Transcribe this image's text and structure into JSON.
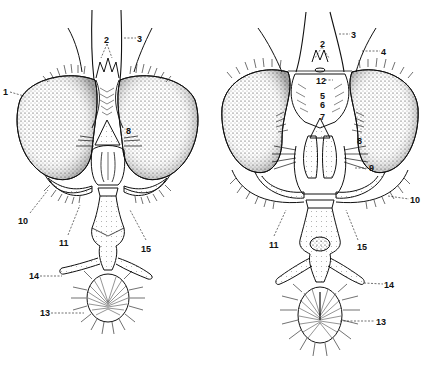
{
  "figure": {
    "type": "anatomical-line-drawing",
    "panels": [
      {
        "id": "left",
        "labels": [
          {
            "text": "1",
            "x": 3,
            "y": 88
          },
          {
            "text": "2",
            "x": 104,
            "y": 36
          },
          {
            "text": "3",
            "x": 137,
            "y": 35
          },
          {
            "text": "8",
            "x": 126,
            "y": 127
          },
          {
            "text": "10",
            "x": 18,
            "y": 217
          },
          {
            "text": "11",
            "x": 59,
            "y": 239
          },
          {
            "text": "15",
            "x": 141,
            "y": 245
          },
          {
            "text": "14",
            "x": 29,
            "y": 272
          },
          {
            "text": "13",
            "x": 40,
            "y": 309
          }
        ]
      },
      {
        "id": "right",
        "labels": [
          {
            "text": "2",
            "x": 320,
            "y": 40
          },
          {
            "text": "3",
            "x": 351,
            "y": 31
          },
          {
            "text": "4",
            "x": 381,
            "y": 48
          },
          {
            "text": "12",
            "x": 316,
            "y": 77
          },
          {
            "text": "5",
            "x": 320,
            "y": 92
          },
          {
            "text": "6",
            "x": 320,
            "y": 101
          },
          {
            "text": "7",
            "x": 320,
            "y": 113
          },
          {
            "text": "8",
            "x": 357,
            "y": 137
          },
          {
            "text": "9",
            "x": 369,
            "y": 164
          },
          {
            "text": "10",
            "x": 410,
            "y": 196
          },
          {
            "text": "11",
            "x": 269,
            "y": 241
          },
          {
            "text": "15",
            "x": 357,
            "y": 243
          },
          {
            "text": "14",
            "x": 384,
            "y": 281
          },
          {
            "text": "13",
            "x": 376,
            "y": 318
          }
        ]
      }
    ]
  },
  "colors": {
    "ink": "#111111",
    "paper": "#ffffff",
    "stipple": "#333333"
  }
}
